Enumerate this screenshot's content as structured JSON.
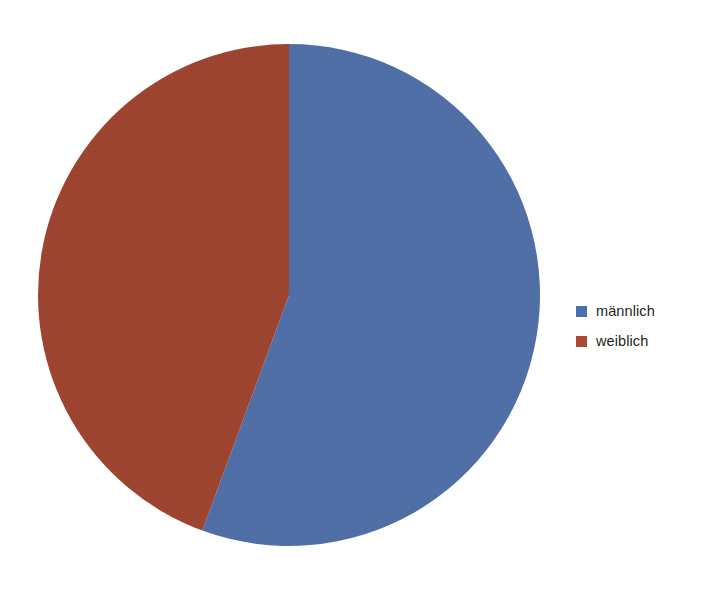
{
  "background_color": "#ffffff",
  "chart_data": {
    "type": "pie",
    "title": "",
    "subtitle": "",
    "xlabel": "",
    "ylabel": "",
    "grid": false,
    "legend_position": "right",
    "start_angle_deg": 0,
    "direction": "clockwise",
    "categories": [
      "männlich",
      "weiblich"
    ],
    "values": [
      55.6,
      44.4
    ],
    "unit": "%",
    "slices": [
      {
        "label": "männlich",
        "value": 55.6,
        "percent": "55.6%",
        "color": "#4f6fa8",
        "start_angle_deg": 0,
        "end_angle_deg": 200.2
      },
      {
        "label": "weiblich",
        "value": 44.4,
        "percent": "44.4%",
        "color": "#9e4430",
        "start_angle_deg": 200.2,
        "end_angle_deg": 360
      }
    ],
    "annotations": [],
    "data_labels_shown": false
  },
  "pie": {
    "center_x": 289,
    "center_y": 295,
    "radius": 251
  },
  "legend": {
    "items": [
      {
        "label": "männlich",
        "color": "#4a6fb0",
        "swatch_name": "legend-swatch-maennlich"
      },
      {
        "label": "weiblich",
        "color": "#a84a32",
        "swatch_name": "legend-swatch-weiblich"
      }
    ]
  }
}
